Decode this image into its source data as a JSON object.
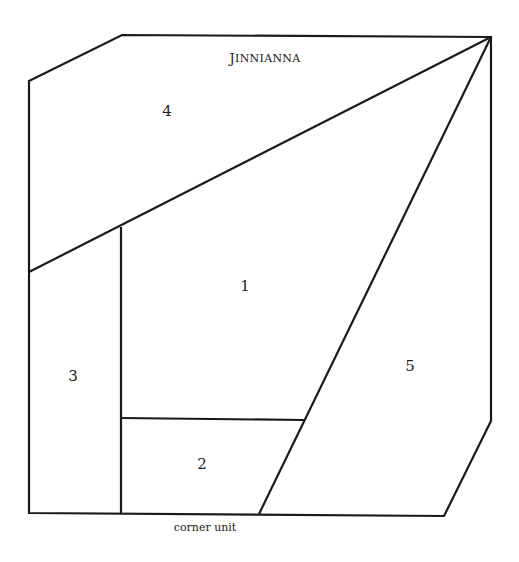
{
  "diagram": {
    "title": "Jinnianna",
    "title_display": {
      "first": "J",
      "rest": "INNIANNA"
    },
    "caption": "corner unit",
    "stroke_color": "#1a1a1a",
    "background": "#ffffff",
    "pieces": [
      {
        "id": "1",
        "label": "1"
      },
      {
        "id": "2",
        "label": "2"
      },
      {
        "id": "3",
        "label": "3"
      },
      {
        "id": "4",
        "label": "4"
      },
      {
        "id": "5",
        "label": "5"
      }
    ]
  }
}
